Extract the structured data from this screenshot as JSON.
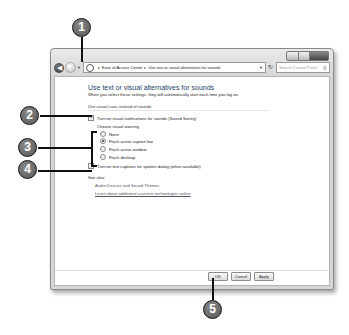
{
  "window": {
    "caption_buttons": [
      "minimize",
      "maximize",
      "close"
    ],
    "nav": {
      "back_icon": "back-arrow-icon",
      "forward_icon": "forward-arrow-icon",
      "breadcrumb": [
        "Ease of Access Center",
        "Use text or visual alternatives for sounds"
      ],
      "breadcrumb_sep": "▸",
      "search_placeholder": "Search Control Panel"
    },
    "page": {
      "title": "Use text or visual alternatives for sounds",
      "subtitle": "When you select these settings, they will automatically start each time you log on.",
      "section_label": "Use visual cues instead of sounds",
      "sound_sentry": {
        "label": "Turn on visual notifications for sounds (Sound Sentry)",
        "checked": true
      },
      "visual_warning_label": "Choose visual warning",
      "visual_warning_options": [
        {
          "label": "None",
          "selected": false
        },
        {
          "label": "Flash active caption bar",
          "selected": true
        },
        {
          "label": "Flash active window",
          "selected": false
        },
        {
          "label": "Flash desktop",
          "selected": false
        }
      ],
      "text_captions": {
        "label": "Turn on text captions for spoken dialog (when available)",
        "checked": false
      },
      "see_also_label": "See also",
      "see_also_links": [
        "Audio Devices and Sound Themes",
        "Learn about additional assistive technologies online"
      ]
    },
    "buttons": {
      "ok": "OK",
      "cancel": "Cancel",
      "apply": "Apply"
    }
  },
  "callouts": [
    "1",
    "2",
    "3",
    "4",
    "5"
  ]
}
